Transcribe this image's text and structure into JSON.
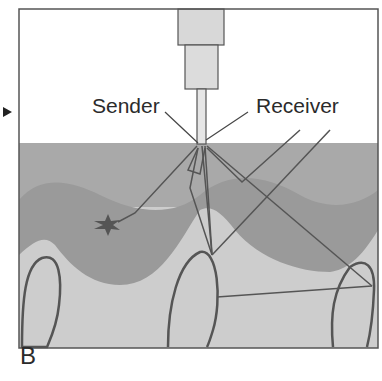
{
  "figure": {
    "panel_label": "B",
    "labels": {
      "sender": "Sender",
      "receiver": "Receiver"
    },
    "elements": [
      "ultrasound-probe",
      "gel-layer",
      "tissue-wave-layer",
      "finger-shapes",
      "lesion-star",
      "sound-beam-lines"
    ],
    "colors": {
      "background": "#ffffff",
      "upper_layer": "#a8a8a8",
      "wave_layer": "#989898",
      "lower_tissue": "#cfcfcf",
      "outline": "#555555",
      "probe": "#d9d9d9"
    }
  }
}
